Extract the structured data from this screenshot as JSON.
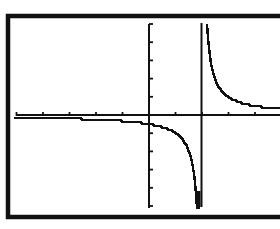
{
  "chart_data": {
    "type": "line",
    "title": "",
    "xlabel": "",
    "ylabel": "",
    "function": "y = 1/(x - 2)",
    "window": {
      "xmin": -5.1,
      "xmax": 4.9,
      "xscl": 1,
      "ymin": -5.1,
      "ymax": 5.3,
      "yscl": 1
    },
    "xlim": [
      -5.1,
      4.9
    ],
    "ylim": [
      -5.1,
      5.3
    ],
    "grid": false,
    "legend": null,
    "vertical_asymptote": 2,
    "x_ticks": [
      -5,
      -4,
      -3,
      -2,
      -1,
      0,
      1,
      2,
      3,
      4
    ],
    "y_ticks": [
      -5,
      -4,
      -3,
      -2,
      -1,
      0,
      1,
      2,
      3,
      4,
      5
    ],
    "series": [
      {
        "name": "left branch",
        "x": [
          -5,
          -4,
          -3,
          -2,
          -1,
          0,
          0.5,
          1,
          1.5,
          1.75,
          1.8
        ],
        "y": [
          -0.14,
          -0.17,
          -0.2,
          -0.25,
          -0.33,
          -0.5,
          -0.67,
          -1,
          -2,
          -4,
          -5
        ]
      },
      {
        "name": "right branch",
        "x": [
          2.2,
          2.25,
          2.5,
          3,
          3.5,
          4,
          4.9
        ],
        "y": [
          5,
          4,
          2,
          1,
          0.67,
          0.5,
          0.34
        ]
      }
    ]
  },
  "display": {
    "frame_color": "#111111",
    "plot_color": "#111111",
    "background": "#ffffff"
  }
}
